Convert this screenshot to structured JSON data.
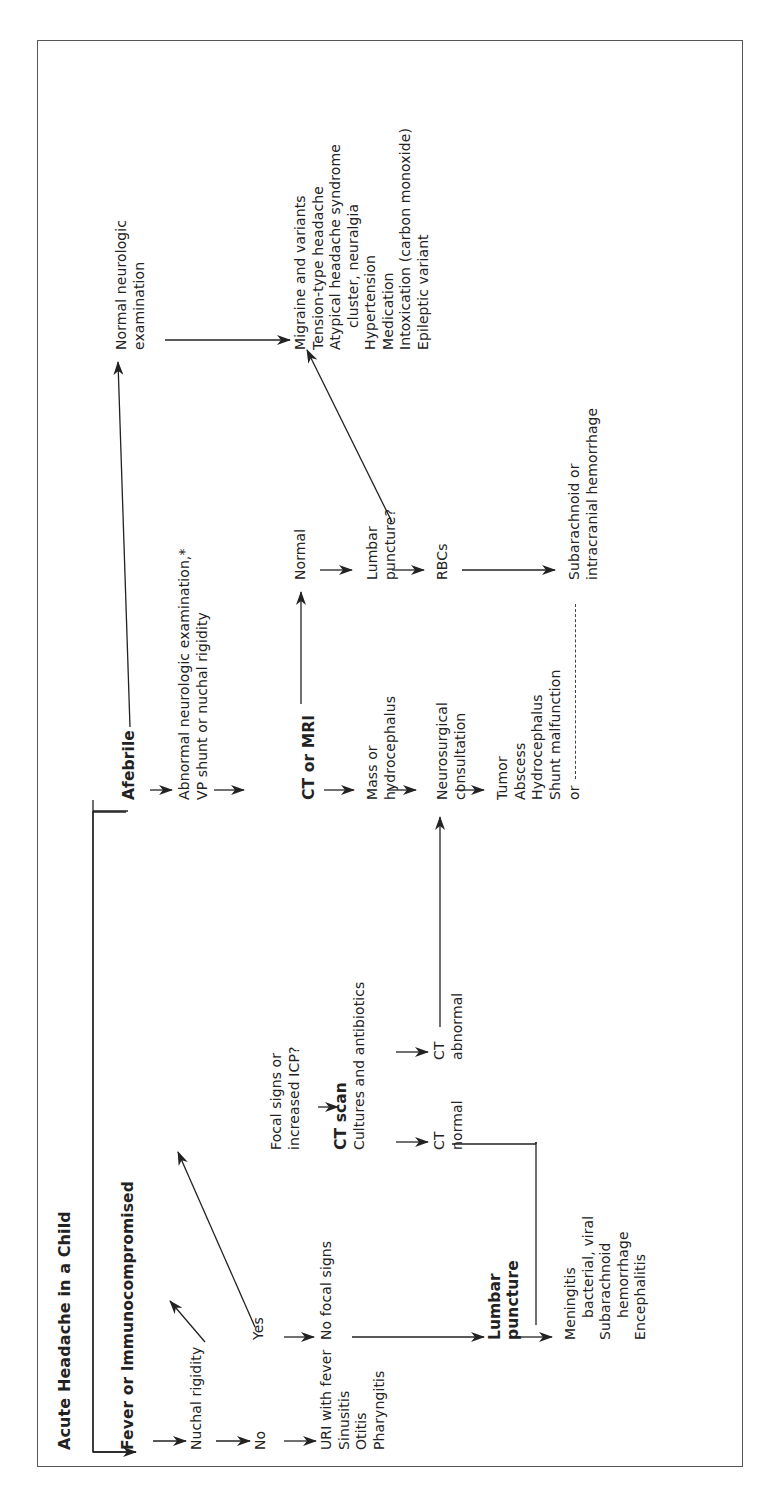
{
  "title": "Acute Headache in a Child",
  "fever_branch": {
    "label": "Fever or Immunocompromised",
    "nuchal_rigidity": "Nuchal rigidity",
    "no": "No",
    "yes": "Yes",
    "no_diagnoses": [
      "URI with fever",
      "Sinusitis",
      "Otitis",
      "Pharyngitis"
    ],
    "no_focal_signs": "No focal signs",
    "focal_signs": [
      "Focal signs or",
      "increased ICP?"
    ],
    "ct_scan": "CT scan",
    "cultures": "Cultures and antibiotics",
    "ct_normal": {
      "ct": "CT",
      "label": "normal"
    },
    "ct_abnormal": {
      "ct": "CT",
      "label": "abnormal"
    },
    "lumbar_puncture": [
      "Lumbar",
      "puncture"
    ],
    "lp_diagnoses": [
      "Meningitis",
      "bacterial, viral",
      "Subarachnoid",
      "hemorrhage",
      "Encephalitis"
    ]
  },
  "afebrile_branch": {
    "label": "Afebrile",
    "abnormal_exam": [
      "Abnormal neurologic examination,*",
      "VP shunt or nuchal rigidity"
    ],
    "ct_or_mri": "CT or MRI",
    "normal": "Normal",
    "mass": [
      "Mass or",
      "hydrocephalus"
    ],
    "lumbar_puncture_q": [
      "Lumbar",
      "puncture?"
    ],
    "neurosurgical": [
      "Neurosurgical",
      "consultation"
    ],
    "rbcs": "RBCs",
    "neuro_diagnoses": [
      "Tumor",
      "Abscess",
      "Hydrocephalus",
      "Shunt malfunction"
    ],
    "or": "or",
    "hemorrhage": [
      "Subarachnoid or",
      "intracranial hemorrhage"
    ],
    "normal_exam": [
      "Normal neurologic",
      "examination"
    ],
    "benign_diagnoses": [
      "Migraine and variants",
      "Tension-type headache",
      "Atypical headache syndrome",
      "cluster, neuralgia",
      "Hypertension",
      "Medication",
      "Intoxication (carbon monoxide)",
      "Epileptic variant"
    ]
  }
}
